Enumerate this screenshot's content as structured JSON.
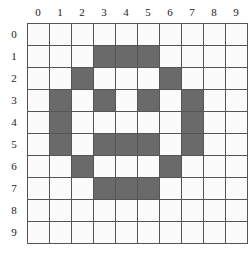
{
  "grid": {
    "rows": 10,
    "cols": 10,
    "col_labels": [
      "0",
      "1",
      "2",
      "3",
      "4",
      "5",
      "6",
      "7",
      "8",
      "9"
    ],
    "row_labels": [
      "0",
      "1",
      "2",
      "3",
      "4",
      "5",
      "6",
      "7",
      "8",
      "9"
    ],
    "fill_color": "#6a6a6a",
    "empty_color": "#fbfbfb",
    "line_color": "#555555",
    "filled_cells": [
      [
        1,
        3
      ],
      [
        1,
        4
      ],
      [
        1,
        5
      ],
      [
        2,
        2
      ],
      [
        2,
        6
      ],
      [
        3,
        1
      ],
      [
        3,
        3
      ],
      [
        3,
        5
      ],
      [
        3,
        7
      ],
      [
        4,
        1
      ],
      [
        4,
        7
      ],
      [
        5,
        1
      ],
      [
        5,
        3
      ],
      [
        5,
        4
      ],
      [
        5,
        5
      ],
      [
        5,
        7
      ],
      [
        6,
        2
      ],
      [
        6,
        6
      ],
      [
        7,
        3
      ],
      [
        7,
        4
      ],
      [
        7,
        5
      ]
    ]
  }
}
